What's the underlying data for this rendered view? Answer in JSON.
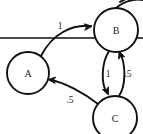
{
  "diagram": {
    "type": "state-transition-diagram",
    "title": "",
    "background_color": "#ffffff",
    "stroke_color": "#111111",
    "artifact_line_color": "#e9e9e9",
    "nodes": [
      {
        "id": "A",
        "label": "A",
        "cx": 28,
        "cy": 73,
        "r": 21
      },
      {
        "id": "B",
        "label": "B",
        "cx": 116,
        "cy": 30,
        "r": 22
      },
      {
        "id": "C",
        "label": "C",
        "cx": 115,
        "cy": 118,
        "r": 22
      }
    ],
    "edges": [
      {
        "id": "a-to-b",
        "from": "A",
        "to": "B",
        "label": "1",
        "label_x": 60,
        "label_y": 26,
        "path": "M 41 56 C 52 34 72 24 91 26",
        "arrow_x": 92,
        "arrow_y": 26.5,
        "arrow_angle": 356
      },
      {
        "id": "b-to-c",
        "from": "B",
        "to": "C",
        "label": "1",
        "label_x": 108,
        "label_y": 74,
        "path": "M 109 51 C 101 64 101 84 107 93",
        "arrow_x": 108.5,
        "arrow_y": 95,
        "arrow_angle": 66
      },
      {
        "id": "c-to-b",
        "from": "C",
        "to": "B",
        "label": ".5",
        "label_x": 128,
        "label_y": 74,
        "path": "M 119 96 C 126 86 126 64 120 53",
        "arrow_x": 119,
        "arrow_y": 51,
        "arrow_angle": 249
      },
      {
        "id": "c-to-a",
        "from": "C",
        "to": "A",
        "label": ".5",
        "label_x": 70,
        "label_y": 100,
        "path": "M 98 104 C 84 93 64 82 50 80",
        "arrow_x": 48,
        "arrow_y": 79.5,
        "arrow_angle": 186
      }
    ],
    "fragments": [
      {
        "id": "top-right-clipped-arc",
        "path": "M 113 11 C 121 2 134 -2 143 0"
      },
      {
        "id": "top-right-clipped-arc-outer",
        "path": "M 120 2 C 128 -3 138 -5 143 -7"
      }
    ],
    "artifact": {
      "id": "horizontal-scanline",
      "y": 38,
      "x1": 0,
      "x2": 143
    }
  }
}
